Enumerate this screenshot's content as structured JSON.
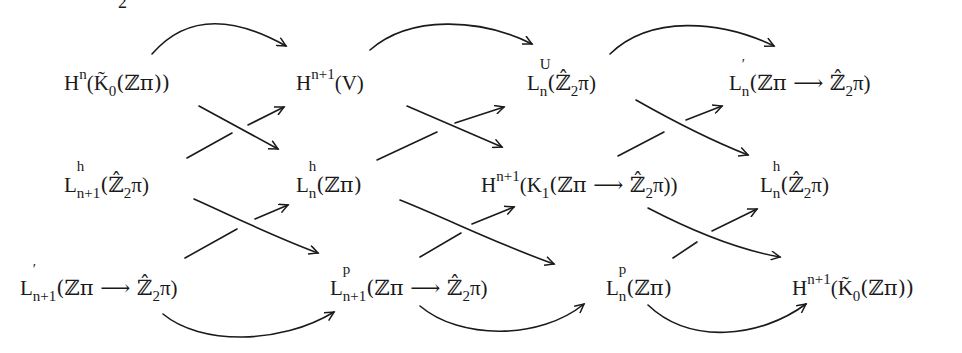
{
  "diagram": {
    "type": "braid commutative diagram",
    "cropped_fragment": "2",
    "nodes": {
      "r1c1": {
        "base": "H",
        "sup": "n",
        "arg": "(K̃",
        "argsub": "0",
        "rest": "(ℤπ))"
      },
      "r1c2": {
        "base": "H",
        "sup": "n+1",
        "rest": "(V)"
      },
      "r1c3": {
        "base": "L",
        "sup": "U",
        "sub": "n",
        "rest": "(ℤ̂",
        "restsub": "2",
        "tail": "π)"
      },
      "r1c4": {
        "base": "L",
        "sup": "′",
        "sub": "n",
        "rest": "(ℤπ ⟶ ℤ̂",
        "restsub": "2",
        "tail": "π)"
      },
      "r2c1": {
        "base": "L",
        "sup": "h",
        "sub": "n+1",
        "rest": "(ℤ̂",
        "restsub": "2",
        "tail": "π)"
      },
      "r2c2": {
        "base": "L",
        "sup": "h",
        "sub": "n",
        "rest": "(ℤπ)"
      },
      "r2c3": {
        "base": "H",
        "sup": "n+1",
        "rest": "(K",
        "restsub": "1",
        "tail": "(ℤπ ⟶ ℤ̂",
        "tailsub": "2",
        "tail2": "π))"
      },
      "r2c4": {
        "base": "L",
        "sup": "h",
        "sub": "n",
        "rest": "(ℤ̂",
        "restsub": "2",
        "tail": "π)"
      },
      "r3c1": {
        "base": "L",
        "sup": "′",
        "sub": "n+1",
        "rest": "(ℤπ ⟶ ℤ̂",
        "restsub": "2",
        "tail": "π)"
      },
      "r3c2": {
        "base": "L",
        "sup": "p",
        "sub": "n+1",
        "rest": "(ℤπ ⟶ ℤ̂",
        "restsub": "2",
        "tail": "π)"
      },
      "r3c3": {
        "base": "L",
        "sup": "p",
        "sub": "n",
        "rest": "(ℤπ)"
      },
      "r3c4": {
        "base": "H",
        "sup": "n+1",
        "rest": "(K̃",
        "restsub": "0",
        "tail": "(ℤπ))"
      }
    },
    "arrows": [
      {
        "from": "r1c1",
        "to": "r1c2",
        "kind": "curved-top"
      },
      {
        "from": "r1c2",
        "to": "r1c3",
        "kind": "curved-top"
      },
      {
        "from": "r1c3",
        "to": "r1c4",
        "kind": "curved-top"
      },
      {
        "from": "r1c1",
        "to": "r2c2",
        "kind": "diagonal"
      },
      {
        "from": "r2c1",
        "to": "r1c2",
        "kind": "diagonal"
      },
      {
        "from": "r1c2",
        "to": "r2c3",
        "kind": "diagonal"
      },
      {
        "from": "r2c2",
        "to": "r1c3",
        "kind": "diagonal"
      },
      {
        "from": "r1c3",
        "to": "r2c4",
        "kind": "diagonal"
      },
      {
        "from": "r2c3",
        "to": "r1c4",
        "kind": "diagonal"
      },
      {
        "from": "r2c1",
        "to": "r3c2",
        "kind": "diagonal"
      },
      {
        "from": "r3c1",
        "to": "r2c2",
        "kind": "diagonal"
      },
      {
        "from": "r2c2",
        "to": "r3c3",
        "kind": "diagonal"
      },
      {
        "from": "r3c2",
        "to": "r2c3",
        "kind": "diagonal"
      },
      {
        "from": "r2c3",
        "to": "r3c4",
        "kind": "diagonal"
      },
      {
        "from": "r3c3",
        "to": "r2c4",
        "kind": "diagonal"
      },
      {
        "from": "r3c1",
        "to": "r3c2",
        "kind": "curved-bottom"
      },
      {
        "from": "r3c2",
        "to": "r3c3",
        "kind": "curved-bottom"
      },
      {
        "from": "r3c3",
        "to": "r3c4",
        "kind": "curved-bottom"
      }
    ],
    "stroke_color": "#1a1a1a",
    "background": "#ffffff"
  }
}
